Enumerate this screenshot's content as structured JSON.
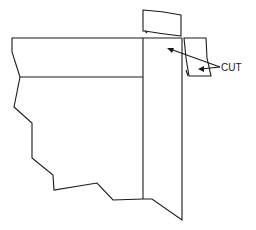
{
  "diagram": {
    "type": "technical-line-drawing",
    "labels": {
      "cut": "CUT"
    },
    "colors": {
      "line": "#1a1a1a",
      "background": "#ffffff"
    }
  }
}
